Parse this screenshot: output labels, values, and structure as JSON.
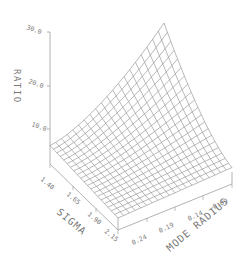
{
  "chart_data": {
    "type": "surface3d",
    "title": "",
    "zlabel": "RATIO",
    "xlabel": "SIGMA",
    "ylabel": "MODE RADIUS",
    "z_ticks": [
      "10.0",
      "20.0",
      "30.0"
    ],
    "z_tick_values": [
      10.0,
      20.0,
      30.0
    ],
    "zlim": [
      5.0,
      30.0
    ],
    "x_ticks": [
      "1.40",
      "1.65",
      "1.90",
      "2.15"
    ],
    "x_tick_values": [
      1.4,
      1.65,
      1.9,
      2.15
    ],
    "y_ticks": [
      "0.24",
      "0.19",
      "0.14",
      "0.09"
    ],
    "y_tick_values": [
      0.24,
      0.19,
      0.14,
      0.09
    ],
    "grid_lines_per_axis": 20,
    "surface_description": "Ratio increases toward high SIGMA / low MODE RADIUS back corner, peak near 25; minimum near front corner (~7)",
    "corner_values": {
      "sigma_1.40_radius_0.24": 8.0,
      "sigma_1.40_radius_0.09": 13.0,
      "sigma_2.15_radius_0.24": 7.0,
      "sigma_2.15_radius_0.09": 25.0
    },
    "colors": {
      "mesh": "#8a8a8a",
      "axis": "#9a9a9a",
      "text": "#7a7a7a",
      "background": "#ffffff"
    }
  }
}
